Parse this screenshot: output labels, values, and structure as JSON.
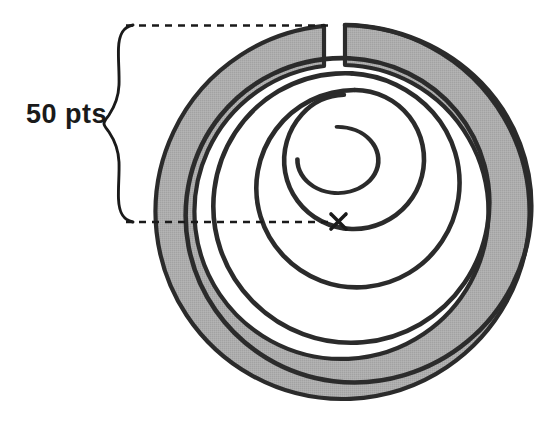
{
  "figure": {
    "kind": "spiral-target-diagram",
    "background_color": "#ffffff",
    "title_text": "",
    "annotation": {
      "dimension_label": "50 pts",
      "brace_orientation": "vertical-left-pointing",
      "leader_line_style": "dashed",
      "leader_line_color": "#1a1a1a",
      "top_leader": {
        "x_start": 125,
        "x_end": 332,
        "y": 25
      },
      "bottom_leader": {
        "x_start": 125,
        "x_end": 345,
        "y": 222
      },
      "brace": {
        "x": 122,
        "y_top": 25,
        "y_bottom": 222,
        "tip_x": 104,
        "mid_y": 123
      }
    },
    "center_marker": {
      "symbol": "x",
      "cx": 339,
      "cy": 221,
      "color": "#1a1a1a",
      "size": 16
    },
    "spiral": {
      "type": "archimedean",
      "center_x": 345,
      "center_y": 212,
      "start_angle_deg": -90,
      "turns": 4.0,
      "inner_radius": 22,
      "outer_radius": 187,
      "turn_spacing": 41,
      "line_color": "#2b2b2b",
      "line_width": 4.5,
      "fill_color": "#aaaaaa",
      "fill_edge_color": "#2b2b2b",
      "disc_radius": 187,
      "disc_cx": 345,
      "disc_cy": 212
    },
    "measurement": {
      "value": 50,
      "unit": "pts",
      "meaning": "radial-distance-per-spiral-turn"
    },
    "colors": {
      "ink": "#1a1a1a",
      "spiral_stroke": "#2b2b2b",
      "fill_gray": "#aaaaaa",
      "paper": "#ffffff"
    }
  }
}
